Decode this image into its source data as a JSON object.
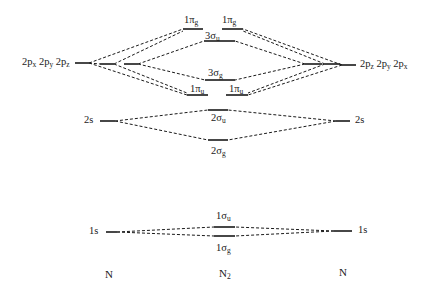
{
  "diagram": {
    "columns": {
      "left_atom": "N",
      "molecule": {
        "base": "N",
        "sub": "2"
      },
      "right_atom": "N"
    },
    "atomic_orbitals": {
      "left_2p": [
        {
          "base": "2p",
          "sub": "x"
        },
        {
          "base": "2p",
          "sub": "y"
        },
        {
          "base": "2p",
          "sub": "z"
        }
      ],
      "right_2p": [
        {
          "base": "2p",
          "sub": "z"
        },
        {
          "base": "2p",
          "sub": "y"
        },
        {
          "base": "2p",
          "sub": "x"
        }
      ],
      "left_2s": "2s",
      "right_2s": "2s",
      "left_1s": "1s",
      "right_1s": "1s"
    },
    "molecular_orbitals": [
      {
        "id": "1pi_g_a",
        "base": "1π",
        "sub": "g",
        "type": "antibonding pi"
      },
      {
        "id": "1pi_g_b",
        "base": "1π",
        "sub": "g",
        "type": "antibonding pi"
      },
      {
        "id": "3sigma_u",
        "base": "3σ",
        "sub": "u",
        "type": "antibonding sigma"
      },
      {
        "id": "3sigma_g",
        "base": "3σ",
        "sub": "g",
        "type": "bonding sigma"
      },
      {
        "id": "1pi_u_a",
        "base": "1π",
        "sub": "u",
        "type": "bonding pi"
      },
      {
        "id": "1pi_u_b",
        "base": "1π",
        "sub": "u",
        "type": "bonding pi"
      },
      {
        "id": "2sigma_u",
        "base": "2σ",
        "sub": "u",
        "type": "antibonding sigma"
      },
      {
        "id": "2sigma_g",
        "base": "2σ",
        "sub": "g",
        "type": "bonding sigma"
      },
      {
        "id": "1sigma_u",
        "base": "1σ",
        "sub": "u",
        "type": "antibonding sigma"
      },
      {
        "id": "1sigma_g",
        "base": "1σ",
        "sub": "g",
        "type": "bonding sigma"
      }
    ],
    "colors": {
      "line": "#1a1a1a",
      "background": "#ffffff"
    }
  }
}
